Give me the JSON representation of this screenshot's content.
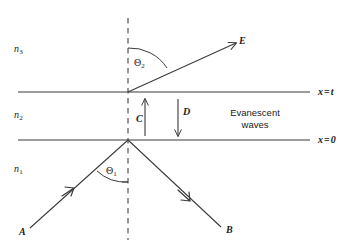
{
  "figure": {
    "type": "optics-ray-diagram",
    "background_color": "#ffffff",
    "line_color": "#3a3a3a",
    "text_color": "#1a1a1a",
    "width": 357,
    "height": 243
  },
  "media": {
    "top": {
      "name": "n",
      "subscript": "3"
    },
    "middle": {
      "name": "n",
      "subscript": "2"
    },
    "bottom": {
      "name": "n",
      "subscript": "1"
    }
  },
  "boundaries": [
    {
      "id": "upper-interface",
      "variable": "x",
      "equals": "=",
      "value": "t",
      "label": "x = t",
      "y": 92
    },
    {
      "id": "lower-interface",
      "variable": "x",
      "equals": "=",
      "value": "0",
      "label": "x = 0",
      "y": 140
    }
  ],
  "rays": [
    {
      "id": "incident-ray",
      "label": "A",
      "description": "incident ray travelling up-right toward lower interface",
      "from": [
        30,
        228
      ],
      "to": [
        128,
        140
      ]
    },
    {
      "id": "reflected-ray",
      "label": "B",
      "description": "totally internally reflected ray travelling down-right",
      "from": [
        128,
        140
      ],
      "to": [
        222,
        228
      ]
    },
    {
      "id": "evanescent-up",
      "label": "C",
      "description": "upward evanescent field arrow in middle layer",
      "from": [
        145,
        135
      ],
      "to": [
        145,
        98
      ]
    },
    {
      "id": "evanescent-down",
      "label": "D",
      "description": "downward evanescent field arrow in middle layer",
      "from": [
        178,
        100
      ],
      "to": [
        178,
        135
      ]
    },
    {
      "id": "transmitted-ray",
      "label": "E",
      "description": "transmitted ray emerging into top medium",
      "from": [
        128,
        92
      ],
      "to": [
        238,
        42
      ]
    }
  ],
  "angles": [
    {
      "id": "theta-2",
      "glyph": "Θ",
      "subscript": "2",
      "label": "Θ2",
      "description": "refraction angle in medium n3 measured from the normal"
    },
    {
      "id": "theta-1",
      "glyph": "Θ",
      "subscript": "1",
      "label": "Θ1",
      "description": "incidence angle in medium n1 measured from the normal"
    }
  ],
  "annotations": {
    "evanescent": {
      "line1": "Evanescent",
      "line2": "waves"
    }
  },
  "normal_line": {
    "id": "normal-dashed-line",
    "style": "dashed",
    "x": 128,
    "y_top": 18,
    "y_bottom": 240
  }
}
